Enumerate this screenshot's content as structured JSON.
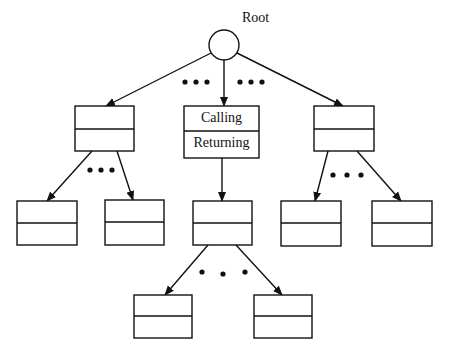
{
  "diagram": {
    "root_label": "Root",
    "center_node": {
      "top_label": "Calling",
      "bottom_label": "Returning"
    },
    "ellipsis": "•••",
    "colors": {
      "stroke": "#111111",
      "background": "#ffffff"
    },
    "nodes": [
      {
        "id": "root",
        "type": "circle"
      },
      {
        "id": "level1-left",
        "type": "record"
      },
      {
        "id": "level1-center",
        "type": "record"
      },
      {
        "id": "level1-right",
        "type": "record"
      },
      {
        "id": "level2-left-a",
        "type": "record"
      },
      {
        "id": "level2-left-b",
        "type": "record"
      },
      {
        "id": "level2-center",
        "type": "record"
      },
      {
        "id": "level2-right-a",
        "type": "record"
      },
      {
        "id": "level2-right-b",
        "type": "record"
      },
      {
        "id": "level3-a",
        "type": "record"
      },
      {
        "id": "level3-b",
        "type": "record"
      }
    ]
  }
}
